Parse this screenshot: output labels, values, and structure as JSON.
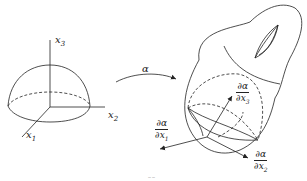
{
  "figure": {
    "type": "mapping-diagram",
    "domain_axes": {
      "x1": {
        "var": "x",
        "sub": "1"
      },
      "x2": {
        "var": "x",
        "sub": "2"
      },
      "x3": {
        "var": "x",
        "sub": "3"
      }
    },
    "map_label": "α",
    "tangent_vectors": [
      {
        "id": "d1",
        "num": "∂α",
        "den_var": "∂x",
        "den_sub": "1"
      },
      {
        "id": "d2",
        "num": "∂α",
        "den_var": "∂x",
        "den_sub": "2"
      },
      {
        "id": "d3",
        "num": "∂α",
        "den_var": "∂x",
        "den_sub": "3"
      }
    ],
    "caption_fragment": "‾‾"
  },
  "colors": {
    "stroke": "#222222",
    "background": "#ffffff"
  }
}
